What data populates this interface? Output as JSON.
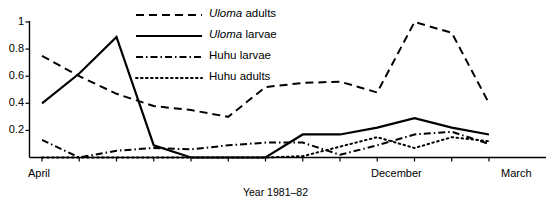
{
  "chart_data": {
    "type": "line",
    "title": "",
    "subtitle": "",
    "xlabel": "Year 1981–82",
    "ylabel": "",
    "x": [
      1,
      2,
      3,
      4,
      5,
      6,
      7,
      8,
      9,
      10,
      11,
      12,
      13
    ],
    "categories": [
      "April",
      "",
      "",
      "",
      "",
      "",
      "",
      "",
      "December",
      "",
      "",
      "",
      "March"
    ],
    "xtick_labels": [
      "April",
      "December",
      "March"
    ],
    "xtick_label_positions": [
      1,
      9,
      13
    ],
    "ytick_labels": [
      "0",
      "0.2",
      "0.4",
      "0.6",
      "0.8",
      "1"
    ],
    "yticks": [
      0,
      0.2,
      0.4,
      0.6,
      0.8,
      1.0
    ],
    "ylim": [
      0,
      1.0
    ],
    "xlim": [
      1,
      13
    ],
    "grid": false,
    "legend_position": "top-center",
    "series": [
      {
        "name": "Uloma adults",
        "name_italic_prefix": "Uloma",
        "name_rest": " adults",
        "style": "dashed",
        "color": "#000000",
        "values": [
          0.75,
          0.6,
          0.47,
          0.38,
          0.35,
          0.3,
          0.52,
          0.55,
          0.56,
          0.48,
          1.0,
          0.92,
          0.4
        ]
      },
      {
        "name": "Uloma larvae",
        "name_italic_prefix": "Uloma",
        "name_rest": " larvae",
        "style": "solid",
        "color": "#000000",
        "values": [
          0.4,
          0.62,
          0.89,
          0.09,
          0.0,
          0.0,
          0.0,
          0.17,
          0.17,
          0.22,
          0.29,
          0.22,
          0.17
        ]
      },
      {
        "name": "Huhu larvae",
        "name_italic_prefix": "",
        "name_rest": "Huhu larvae",
        "style": "dashdot",
        "color": "#000000",
        "values": [
          0.13,
          0.0,
          0.05,
          0.07,
          0.06,
          0.09,
          0.11,
          0.11,
          0.02,
          0.09,
          0.17,
          0.19,
          0.1
        ]
      },
      {
        "name": "Huhu adults",
        "name_italic_prefix": "",
        "name_rest": "Huhu adults",
        "style": "dotted",
        "color": "#000000",
        "values": [
          0.0,
          0.0,
          0.0,
          0.0,
          0.0,
          0.0,
          0.0,
          0.01,
          0.08,
          0.15,
          0.07,
          0.15,
          0.12
        ]
      }
    ]
  },
  "axes": {
    "y_labels": [
      {
        "text": "1",
        "value": 1.0
      },
      {
        "text": "0.8",
        "value": 0.8
      },
      {
        "text": "0.6",
        "value": 0.6
      },
      {
        "text": "0.4",
        "value": 0.4
      },
      {
        "text": "0.2",
        "value": 0.2
      }
    ],
    "x_labels": [
      {
        "text": "April",
        "index": 1
      },
      {
        "text": "December",
        "index": 9
      },
      {
        "text": "March",
        "index": 13
      }
    ]
  },
  "caption": {
    "text": "Year 1981–82"
  },
  "legend": {
    "items": [
      {
        "italic": "Uloma",
        "rest": " adults",
        "style": "dashed"
      },
      {
        "italic": "Uloma",
        "rest": " larvae",
        "style": "solid"
      },
      {
        "italic": "",
        "rest": "Huhu larvae",
        "style": "dashdot"
      },
      {
        "italic": "",
        "rest": "Huhu adults",
        "style": "dotted"
      }
    ]
  }
}
